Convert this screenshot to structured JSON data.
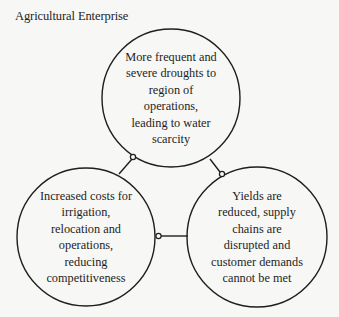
{
  "title": "Agricultural Enterprise",
  "nodes": [
    {
      "id": "droughts",
      "lines": [
        "More frequent and",
        "severe droughts to",
        "region of",
        "operations,",
        "leading to water",
        "scarcity"
      ]
    },
    {
      "id": "costs",
      "lines": [
        "Increased costs for",
        "irrigation,",
        "relocation and",
        "operations,",
        "reducing",
        "competitiveness"
      ]
    },
    {
      "id": "yields",
      "lines": [
        "Yields are",
        "reduced, supply",
        "chains are",
        "disrupted and",
        "customer demands",
        "cannot be met"
      ]
    }
  ],
  "connections": [
    {
      "from": "droughts",
      "to": "costs"
    },
    {
      "from": "droughts",
      "to": "yields"
    },
    {
      "from": "costs",
      "to": "yields"
    }
  ],
  "colors": {
    "stroke": "#1e1e1e",
    "background": "#f7f7f5"
  }
}
